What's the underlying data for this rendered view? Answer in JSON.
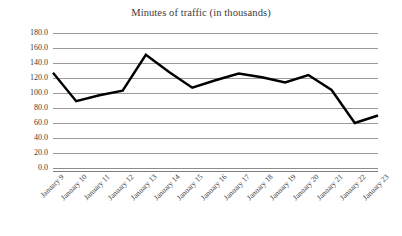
{
  "chart_data": {
    "type": "line",
    "title": "Minutes of traffic (in thousands)",
    "xlabel": "",
    "ylabel": "",
    "categories": [
      "January 9",
      "January 10",
      "January 11",
      "January 12",
      "January 13",
      "January 14",
      "January 15",
      "January 16",
      "January 17",
      "January 18",
      "January 19",
      "January 20",
      "January 21",
      "January 22",
      "January 23"
    ],
    "values": [
      127.0,
      89.0,
      97.0,
      103.0,
      151.0,
      128.0,
      107.0,
      117.0,
      126.0,
      121.0,
      114.0,
      124.0,
      104.0,
      60.0,
      70.0
    ],
    "ylim": [
      0.0,
      180.0
    ],
    "ytick_step": 20.0,
    "ytick_labels": [
      "180.0",
      "160.0",
      "140.0",
      "120.0",
      "100.0",
      "80.0",
      "60.0",
      "40.0",
      "20.0",
      "0.0"
    ],
    "ytick_values": [
      180.0,
      160.0,
      140.0,
      120.0,
      100.0,
      80.0,
      60.0,
      40.0,
      20.0,
      0.0
    ],
    "grid": true,
    "grid_orientation": "horizontal",
    "legend": false,
    "legend_position": "none",
    "series_color": "#000000",
    "grid_color": "#9a9a9a",
    "background_color": "#ffffff",
    "text_color": "#3d3d3d",
    "series_line_width": 2.4,
    "markers": false,
    "xtick_rotation": -45
  }
}
